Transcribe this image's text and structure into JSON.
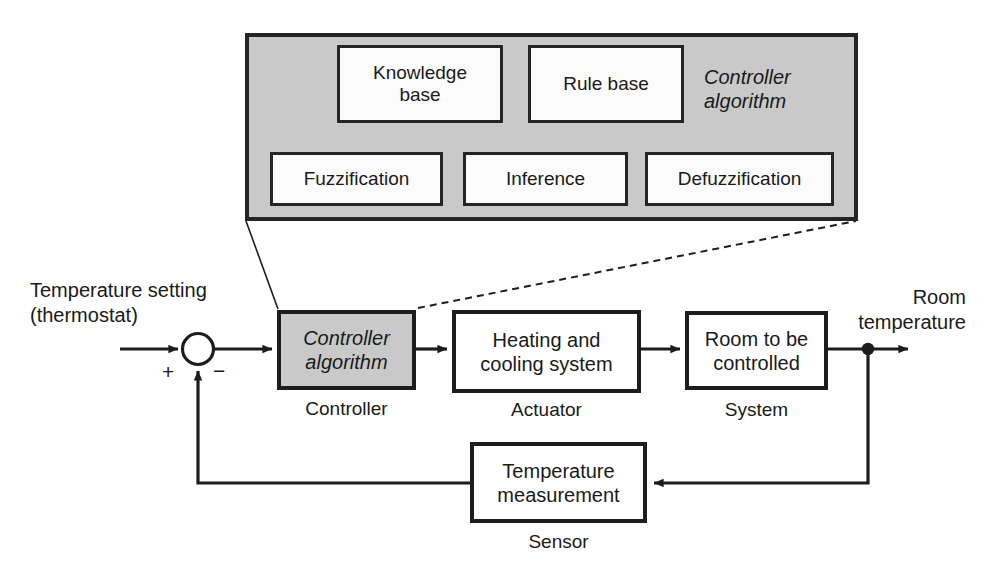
{
  "figure": {
    "colors": {
      "shaded_fill": "#c9c9c9",
      "box_fill": "#ffffff",
      "stroke": "#1d1d1d",
      "background": "#ffffff"
    }
  },
  "controller_panel": {
    "caption": "Controller\nalgorithm",
    "boxes": {
      "knowledge_base": "Knowledge\nbase",
      "rule_base": "Rule base",
      "fuzzification": "Fuzzification",
      "inference": "Inference",
      "defuzzification": "Defuzzification"
    },
    "connections": [
      {
        "from": "knowledge_base",
        "to": "fuzzification",
        "style": "arrow-down"
      },
      {
        "from": "rule_base",
        "to": "inference",
        "style": "arrow-down"
      },
      {
        "from": "fuzzification",
        "to": "inference",
        "style": "arrow-right"
      },
      {
        "from": "inference",
        "to": "defuzzification",
        "style": "arrow-right"
      }
    ]
  },
  "zoom_connectors": {
    "left_style": "solid",
    "right_style": "dashed"
  },
  "loop": {
    "input_label": "Temperature setting\n(thermostat)",
    "output_label": "Room\ntemperature",
    "summing_junction": {
      "plus_sign": "+",
      "minus_sign": "−"
    },
    "blocks": [
      {
        "id": "controller",
        "text": "Controller\nalgorithm",
        "caption": "Controller",
        "shaded": true
      },
      {
        "id": "actuator",
        "text": "Heating and\ncooling system",
        "caption": "Actuator",
        "shaded": false
      },
      {
        "id": "system",
        "text": "Room to be\ncontrolled",
        "caption": "System",
        "shaded": false
      }
    ],
    "feedback": {
      "id": "sensor",
      "text": "Temperature\nmeasurement",
      "caption": "Sensor"
    }
  }
}
